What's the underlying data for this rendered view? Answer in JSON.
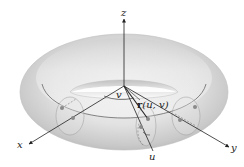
{
  "figure": {
    "type": "torus-parametrization",
    "axes": {
      "x_label": "x",
      "y_label": "y",
      "z_label": "z"
    },
    "parameters": {
      "u_label": "u",
      "v_label": "v"
    },
    "vector_label": "r(u, v)",
    "vector_label_parts": {
      "bold": "r",
      "args": "(u, v)"
    },
    "colors": {
      "surface_light": "#f2f2f2",
      "surface_mid": "#d4d4d4",
      "surface_dark": "#b8b8b8",
      "line": "#333333",
      "dot": "#8a8a8a"
    }
  }
}
